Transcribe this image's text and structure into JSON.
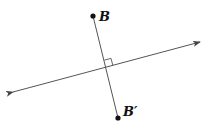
{
  "diagram": {
    "title": "",
    "colors": {
      "background": "#ffffff",
      "stroke": "#555555",
      "point": "#111111",
      "label": "#111111"
    },
    "points": [
      {
        "id": "B",
        "label": "B",
        "x": 93,
        "y": 16,
        "label_x": 99,
        "label_y": 21
      },
      {
        "id": "B_prime",
        "label": "B′",
        "x": 118,
        "y": 118,
        "label_x": 123,
        "label_y": 116
      }
    ],
    "line_of_reflection": {
      "x1": 13,
      "y1": 92,
      "x2": 200,
      "y2": 42,
      "arrows": "both"
    },
    "segment": {
      "from": "B",
      "to": "B_prime"
    },
    "intersection": {
      "x": 106,
      "y": 67
    },
    "right_angle_marker": true
  }
}
